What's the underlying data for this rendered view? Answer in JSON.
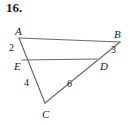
{
  "problem": {
    "number_label": "16."
  },
  "figure": {
    "stroke_color": "#6b6b6b",
    "text_color": "#1a1a1a",
    "background": "#ffffff",
    "vertices": [
      {
        "name": "A",
        "label": "A",
        "x": 19,
        "y": 38,
        "label_x": 15,
        "label_y": 26
      },
      {
        "name": "B",
        "label": "B",
        "x": 120,
        "y": 42,
        "label_x": 114,
        "label_y": 29
      },
      {
        "name": "E",
        "label": "E",
        "x": 22,
        "y": 60,
        "label_x": 14,
        "label_y": 61
      },
      {
        "name": "D",
        "label": "D",
        "x": 97,
        "y": 59,
        "label_x": 100,
        "label_y": 61
      },
      {
        "name": "C",
        "label": "C",
        "x": 45,
        "y": 103,
        "label_x": 42,
        "label_y": 109
      }
    ],
    "segments": [
      {
        "name": "segment-AB",
        "from": "A",
        "to": "B",
        "x1": 19,
        "y1": 38,
        "x2": 120,
        "y2": 42
      },
      {
        "name": "segment-ED",
        "from": "E",
        "to": "D",
        "x1": 22,
        "y1": 60,
        "x2": 97,
        "y2": 59
      },
      {
        "name": "segment-AC",
        "from": "A",
        "to": "C",
        "x1": 19,
        "y1": 38,
        "x2": 45,
        "y2": 103
      },
      {
        "name": "segment-BC",
        "from": "B",
        "to": "C",
        "x1": 120,
        "y1": 42,
        "x2": 45,
        "y2": 103
      }
    ],
    "angle_labels": [
      {
        "name": "angle-2",
        "label": "2",
        "x": 9,
        "y": 43
      },
      {
        "name": "angle-3",
        "label": "3",
        "x": 111,
        "y": 45
      },
      {
        "name": "angle-4",
        "label": "4",
        "x": 24,
        "y": 78
      },
      {
        "name": "angle-6",
        "label": "6",
        "x": 67,
        "y": 79
      }
    ]
  }
}
